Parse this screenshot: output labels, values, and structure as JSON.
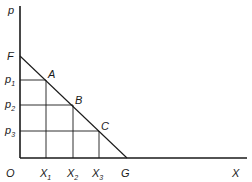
{
  "diagram": {
    "type": "demand-line",
    "axes": {
      "y_label": "p",
      "x_label": "X",
      "origin_label": "O"
    },
    "intercepts": {
      "y_intercept_label": "F",
      "x_intercept_label": "G"
    },
    "points": [
      {
        "label": "A",
        "price_label": "p",
        "price_sub": "1",
        "qty_label": "X",
        "qty_sub": "1"
      },
      {
        "label": "B",
        "price_label": "p",
        "price_sub": "2",
        "qty_label": "X",
        "qty_sub": "2"
      },
      {
        "label": "C",
        "price_label": "p",
        "price_sub": "3",
        "qty_label": "X",
        "qty_sub": "3"
      }
    ],
    "colors": {
      "ink": "#1a1a1a",
      "background": "#ffffff"
    }
  }
}
